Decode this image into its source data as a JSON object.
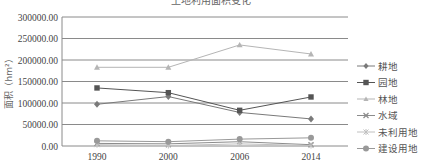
{
  "title": "土地利用面积变化",
  "chart_data": {
    "type": "line",
    "title": "土地利用面积变化",
    "xlabel": "",
    "ylabel": "面积（hm²）",
    "x": [
      "1990",
      "2000",
      "2006",
      "2014"
    ],
    "ylim": [
      0,
      300000
    ],
    "yticks": [
      "0.00",
      "50000.00",
      "100000.00",
      "150000.00",
      "200000.00",
      "250000.00",
      "300000.00"
    ],
    "grid": true,
    "legend_position": "right",
    "series": [
      {
        "name": "耕地",
        "marker": "diamond",
        "color": "#7a7a7a",
        "values": [
          97000,
          115000,
          78000,
          63000
        ]
      },
      {
        "name": "园地",
        "marker": "square",
        "color": "#555555",
        "values": [
          135000,
          124000,
          83000,
          114000
        ]
      },
      {
        "name": "林地",
        "marker": "triangle",
        "color": "#b5b5b5",
        "values": [
          183000,
          183000,
          235000,
          214000
        ]
      },
      {
        "name": "水域",
        "marker": "x",
        "color": "#8c8c8c",
        "values": [
          6000,
          5000,
          10000,
          3000
        ]
      },
      {
        "name": "未利用地",
        "marker": "star",
        "color": "#c0c0c0",
        "values": [
          3000,
          1000,
          5000,
          1000
        ]
      },
      {
        "name": "建设用地",
        "marker": "circle",
        "color": "#999999",
        "values": [
          12000,
          10000,
          16000,
          19000
        ]
      }
    ]
  }
}
